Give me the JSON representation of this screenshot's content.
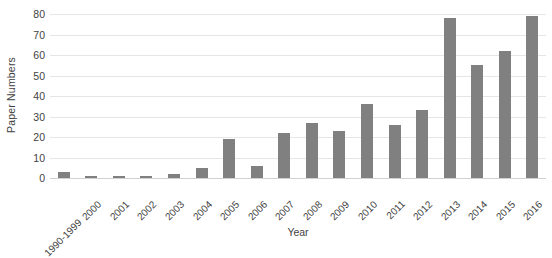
{
  "chart_data": {
    "type": "bar",
    "title": "",
    "xlabel": "Year",
    "ylabel": "Paper Numbers",
    "categories": [
      "1990-1999",
      "2000",
      "2001",
      "2002",
      "2003",
      "2004",
      "2005",
      "2006",
      "2007",
      "2008",
      "2009",
      "2010",
      "2011",
      "2012",
      "2013",
      "2014",
      "2015",
      "2016"
    ],
    "values": [
      3,
      1,
      1,
      1,
      2,
      5,
      19,
      6,
      22,
      27,
      23,
      36,
      26,
      33,
      78,
      55,
      62,
      79
    ],
    "series": [
      {
        "name": "Paper Numbers",
        "values": [
          3,
          1,
          1,
          1,
          2,
          5,
          19,
          6,
          22,
          27,
          23,
          36,
          26,
          33,
          78,
          55,
          62,
          79
        ]
      }
    ],
    "ylim": [
      0,
      80
    ],
    "yticks": [
      0,
      10,
      20,
      30,
      40,
      50,
      60,
      70,
      80
    ],
    "ytick_labels": [
      "0",
      "10",
      "20",
      "30",
      "40",
      "50",
      "60",
      "70",
      "80"
    ],
    "grid": true,
    "grid_axis": "y",
    "legend": false,
    "legend_position": "none",
    "bar_color": "#808080",
    "grid_color": "#e6e6e6",
    "text_color": "#3f3f3f",
    "background_color": "#ffffff",
    "xtick_rotation": 45
  }
}
